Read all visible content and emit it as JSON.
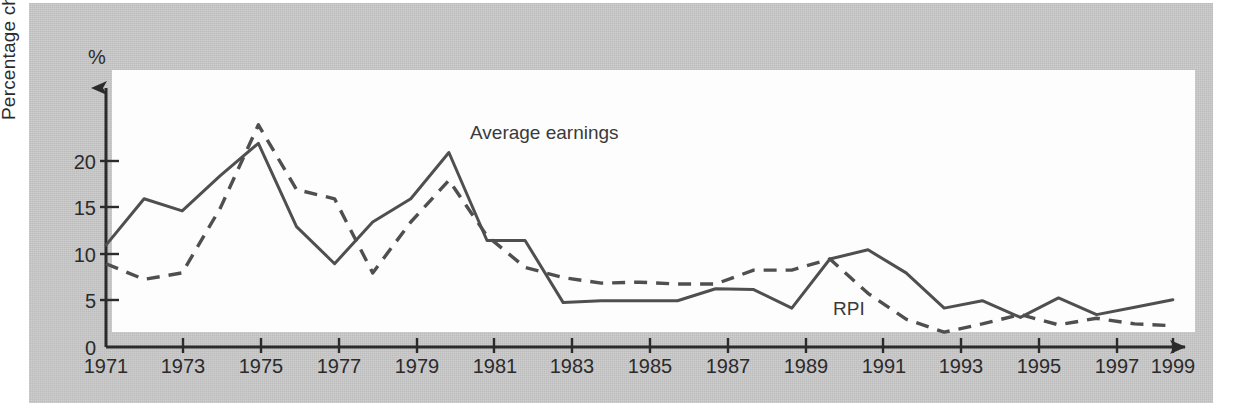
{
  "figure": {
    "background_color": "#c9c9c9",
    "plot_background_color": "#fdfdfd",
    "ink_color": "#4a4a4a"
  },
  "axis": {
    "y_unit": "%",
    "y_title": "Percentage change on previous year",
    "y_ticks": [
      0,
      5,
      10,
      15,
      20
    ],
    "x_ticks": [
      "1971",
      "1973",
      "1975",
      "1977",
      "1979",
      "1981",
      "1983",
      "1985",
      "1987",
      "1989",
      "1991",
      "1993",
      "1995",
      "1997",
      "1999"
    ]
  },
  "labels": {
    "average_earnings": "Average earnings",
    "rpi": "RPI"
  },
  "chart_data": {
    "type": "line",
    "title": "",
    "xlabel": "",
    "ylabel": "Percentage change on previous year",
    "yunit": "%",
    "ylim": [
      0,
      26
    ],
    "xlim": [
      1971,
      1999
    ],
    "grid": false,
    "legend": "inline-annotations",
    "x": [
      1971,
      1972,
      1973,
      1974,
      1975,
      1976,
      1977,
      1978,
      1979,
      1980,
      1981,
      1982,
      1983,
      1984,
      1985,
      1986,
      1987,
      1988,
      1989,
      1990,
      1991,
      1992,
      1993,
      1994,
      1995,
      1996,
      1997,
      1998,
      1999
    ],
    "series": [
      {
        "name": "Average earnings",
        "style": "solid",
        "values": [
          11.0,
          16.0,
          14.7,
          18.5,
          22.0,
          13.0,
          9.0,
          13.5,
          16.0,
          21.0,
          11.5,
          11.5,
          4.8,
          5.0,
          5.0,
          5.0,
          6.3,
          6.2,
          4.2,
          9.5,
          10.5,
          8.0,
          4.2,
          5.0,
          3.2,
          5.3,
          3.5,
          4.3,
          5.1
        ]
      },
      {
        "name": "RPI",
        "style": "dashed",
        "values": [
          9.0,
          7.3,
          8.0,
          15.0,
          24.0,
          17.0,
          16.0,
          8.0,
          13.5,
          18.0,
          12.0,
          8.6,
          7.5,
          6.9,
          7.0,
          6.8,
          6.8,
          8.3,
          8.3,
          9.5,
          5.8,
          3.0,
          1.6,
          2.5,
          3.5,
          2.4,
          3.1,
          2.5,
          2.3
        ]
      }
    ]
  }
}
